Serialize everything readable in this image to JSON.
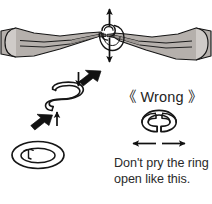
{
  "figure": {
    "kind": "instructional-diagram",
    "background_color": "#ffffff"
  },
  "labels": {
    "wrong_label": "《 Wrong 》",
    "caption_line_1": "Don't pry the ring",
    "caption_line_2": "open like this."
  },
  "colors": {
    "outline": "#1a1a1a",
    "tool_fill": "#b5b0ac",
    "tool_fill_light": "#d8d5d2",
    "tool_fill_dark": "#9c9793",
    "arrow_solid": "#121212",
    "arrow_thin": "#101010",
    "ring_fill": "#ffffff",
    "text": "#2a2a2a"
  },
  "panels": {
    "pliers_panel": {
      "name": "pliers-gripping-ring",
      "description": "Two pliers gripping a split ring at the center",
      "ring_center_x": 108,
      "ring_center_y": 36
    },
    "correct_panel": {
      "name": "correct-twist-method",
      "description": "Ring opened by twisting sideways into an S shape"
    },
    "closed_ring_panel": {
      "name": "closed-split-ring",
      "description": "Closed split ring at rest"
    },
    "wrong_panel": {
      "name": "wrong-pry-method",
      "description": "Ring pried apart horizontally - incorrect"
    }
  },
  "icons": {
    "vertical_double_arrow": "vertical-double-arrow-icon",
    "rotation_curve": "rotation-curve-icon",
    "down_arrow_thin": "down-arrow-thin-icon",
    "up_arrow_thin": "up-arrow-thin-icon",
    "bold_arrow_down_left": "bold-arrow-down-left-icon",
    "left_arrow_thin": "left-arrow-thin-icon",
    "right_arrow_thin": "right-arrow-thin-icon"
  }
}
